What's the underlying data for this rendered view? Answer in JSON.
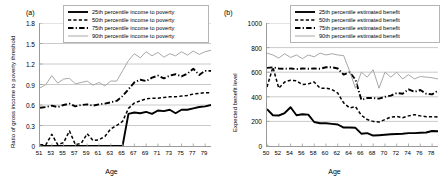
{
  "figure": {
    "panels": [
      "a",
      "b"
    ]
  },
  "panel_a": {
    "label": "(a)",
    "legend": [
      {
        "text": "25th percentile income to poverty",
        "style": "solid-thick",
        "color": "#000000"
      },
      {
        "text": "50th percentile income to poverty",
        "style": "dashed",
        "color": "#000000"
      },
      {
        "text": "75th percentile income to poverty",
        "style": "dash-dot",
        "color": "#000000"
      },
      {
        "text": "90th percentile income to poverty",
        "style": "solid-thin",
        "color": "#a8a8a8"
      }
    ]
  },
  "panel_b": {
    "label": "(b)",
    "legend": [
      {
        "text": "25th percentile estimated benefit",
        "style": "solid-thick",
        "color": "#000000"
      },
      {
        "text": "50th percentile estimated benefit",
        "style": "dashed",
        "color": "#000000"
      },
      {
        "text": "75th percentile estimated benefit",
        "style": "dash-dot",
        "color": "#000000"
      },
      {
        "text": "90th percentile estimated benefit",
        "style": "solid-thin",
        "color": "#a8a8a8"
      }
    ]
  },
  "chart_data": [
    {
      "panel": "a",
      "type": "line",
      "title": "(a)",
      "xlabel": "Age",
      "ylabel": "Ratio of gross income to poverty threshold",
      "xlim": [
        51,
        80
      ],
      "ylim": [
        0,
        1.8
      ],
      "yticks": [
        0,
        0.3,
        0.6,
        0.9,
        1.2,
        1.5,
        1.8
      ],
      "ytick_labels": [
        "0",
        "0.3",
        "0.6",
        "0.9",
        "1.2",
        "1.5",
        "1.8"
      ],
      "xticks": [
        51,
        53,
        55,
        57,
        59,
        61,
        63,
        65,
        67,
        69,
        71,
        73,
        75,
        77,
        79
      ],
      "xtick_labels": [
        "51",
        "53",
        "55",
        "57",
        "59",
        "61",
        "63",
        "65",
        "67",
        "69",
        "71",
        "73",
        "75",
        "77",
        "79"
      ],
      "grid": "horizontal",
      "legend_position": "top-right",
      "x": [
        51,
        52,
        53,
        54,
        55,
        56,
        57,
        58,
        59,
        60,
        61,
        62,
        63,
        64,
        65,
        66,
        67,
        68,
        69,
        70,
        71,
        72,
        73,
        74,
        75,
        76,
        77,
        78,
        79,
        80
      ],
      "series": [
        {
          "name": "25th percentile income to poverty",
          "style": "solid-thick",
          "color": "#000000",
          "values": [
            0,
            0,
            0,
            0,
            0,
            0,
            0,
            0,
            0,
            0,
            0,
            0,
            0,
            0,
            0,
            0.47,
            0.49,
            0.48,
            0.5,
            0.47,
            0.52,
            0.51,
            0.53,
            0.48,
            0.53,
            0.53,
            0.55,
            0.57,
            0.58,
            0.6
          ]
        },
        {
          "name": "50th percentile income to poverty",
          "style": "dashed",
          "color": "#000000",
          "values": [
            0.02,
            0.02,
            0.17,
            0.02,
            0.05,
            0.22,
            0.02,
            0.04,
            0.18,
            0.08,
            0.09,
            0.14,
            0.25,
            0.3,
            0.36,
            0.55,
            0.63,
            0.66,
            0.69,
            0.7,
            0.7,
            0.71,
            0.72,
            0.72,
            0.73,
            0.74,
            0.76,
            0.77,
            0.78,
            0.78
          ]
        },
        {
          "name": "75th percentile income to poverty",
          "style": "dash-dot",
          "color": "#000000",
          "values": [
            0.56,
            0.57,
            0.59,
            0.57,
            0.6,
            0.62,
            0.58,
            0.6,
            0.61,
            0.59,
            0.61,
            0.62,
            0.64,
            0.66,
            0.73,
            0.83,
            0.93,
            0.97,
            0.95,
            1.0,
            1.03,
            0.99,
            1.03,
            1.05,
            1.02,
            1.06,
            1.13,
            1.04,
            1.1,
            1.1
          ]
        },
        {
          "name": "90th percentile income to poverty",
          "style": "solid-thin",
          "color": "#a8a8a8",
          "values": [
            0.85,
            0.9,
            1.03,
            0.92,
            0.98,
            0.99,
            0.91,
            0.93,
            0.95,
            0.89,
            0.93,
            0.88,
            0.95,
            0.95,
            1.1,
            1.25,
            1.35,
            1.29,
            1.38,
            1.32,
            1.37,
            1.3,
            1.35,
            1.32,
            1.38,
            1.33,
            1.39,
            1.34,
            1.38,
            1.4
          ]
        }
      ]
    },
    {
      "panel": "b",
      "type": "line",
      "title": "(b)",
      "xlabel": "Age",
      "ylabel": "Expected benefit level",
      "xlim": [
        50,
        79
      ],
      "ylim": [
        0,
        1000
      ],
      "yticks": [
        0,
        200,
        400,
        600,
        800,
        1000
      ],
      "ytick_labels": [
        "0",
        "200",
        "400",
        "600",
        "800",
        "1000"
      ],
      "xticks": [
        50,
        52,
        54,
        56,
        58,
        60,
        62,
        64,
        66,
        68,
        70,
        72,
        74,
        76,
        78
      ],
      "xtick_labels": [
        "50",
        "52",
        "54",
        "56",
        "58",
        "60",
        "62",
        "64",
        "66",
        "68",
        "70",
        "72",
        "74",
        "76",
        "78"
      ],
      "grid": "horizontal",
      "legend_position": "top-right",
      "x": [
        50,
        51,
        52,
        53,
        54,
        55,
        56,
        57,
        58,
        59,
        60,
        61,
        62,
        63,
        64,
        65,
        66,
        67,
        68,
        69,
        70,
        71,
        72,
        73,
        74,
        75,
        76,
        77,
        78,
        79
      ],
      "series": [
        {
          "name": "25th percentile estimated benefit",
          "style": "solid-thick",
          "color": "#000000",
          "values": [
            300,
            250,
            248,
            268,
            315,
            250,
            258,
            255,
            195,
            185,
            185,
            180,
            175,
            150,
            150,
            148,
            100,
            105,
            85,
            88,
            92,
            95,
            98,
            100,
            105,
            105,
            108,
            110,
            122,
            120
          ]
        },
        {
          "name": "50th percentile estimated benefit",
          "style": "dashed",
          "color": "#000000",
          "values": [
            480,
            640,
            470,
            520,
            535,
            530,
            500,
            505,
            520,
            470,
            470,
            460,
            430,
            350,
            310,
            320,
            250,
            215,
            200,
            195,
            215,
            235,
            240,
            230,
            245,
            255,
            245,
            238,
            238,
            235
          ]
        },
        {
          "name": "75th percentile estimated benefit",
          "style": "dash-dot",
          "color": "#000000",
          "values": [
            635,
            640,
            630,
            628,
            630,
            625,
            630,
            628,
            630,
            628,
            640,
            640,
            630,
            580,
            600,
            540,
            375,
            390,
            390,
            385,
            400,
            410,
            430,
            425,
            460,
            440,
            455,
            425,
            420,
            450
          ]
        },
        {
          "name": "90th percentile estimated benefit",
          "style": "solid-thin",
          "color": "#a8a8a8",
          "values": [
            755,
            740,
            715,
            750,
            720,
            740,
            710,
            740,
            725,
            755,
            740,
            750,
            740,
            735,
            610,
            470,
            600,
            560,
            620,
            470,
            600,
            560,
            600,
            545,
            580,
            545,
            565,
            560,
            555,
            545
          ]
        }
      ]
    }
  ]
}
